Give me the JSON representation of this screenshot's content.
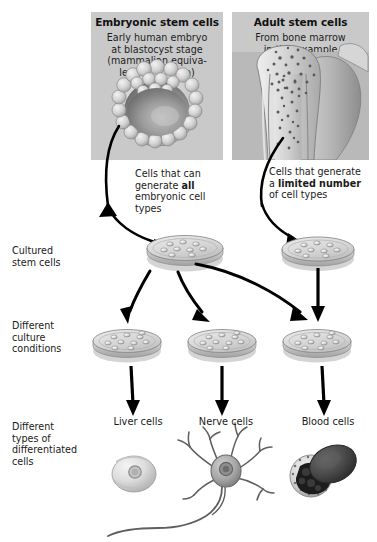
{
  "figure": {
    "background_color": "#ffffff",
    "panel_background_color": "#c9c9c9",
    "arrow_color": "#000000"
  },
  "panels": [
    {
      "id": "embryonic",
      "title": "Embryonic stem cells",
      "subtitle": "Early human embryo\nat blastocyst stage\n(mammalian equiva-\nlent of blastula)",
      "subtitle_lines": [
        "Early human embryo",
        "at blastocyst stage",
        "(mammalian equiva-",
        "lent of blastula)"
      ],
      "illustration": "blastocyst-illustration"
    },
    {
      "id": "adult",
      "title": "Adult stem cells",
      "subtitle_lines": [
        "From bone marrow",
        "in this example"
      ],
      "illustration": "bone-marrow-illustration"
    }
  ],
  "callouts": {
    "embryonic": {
      "line1": "Cells that can",
      "line2_pre": "generate ",
      "line2_bold": "all",
      "line3": "embryonic cell",
      "line4": "types"
    },
    "adult": {
      "line1": "Cells that",
      "line2": "generate a",
      "line3_bold": "limited number",
      "line4": "of cell types"
    }
  },
  "row_labels": [
    {
      "id": "cultured",
      "lines": [
        "Cultured",
        "stem cells"
      ]
    },
    {
      "id": "conditions",
      "lines": [
        "Different",
        "culture",
        "conditions"
      ]
    },
    {
      "id": "types",
      "lines": [
        "Different",
        "types of",
        "differentiated",
        "cells"
      ]
    }
  ],
  "dishes": {
    "cultured": [
      {
        "id": "cultured-dish-embryonic",
        "cell_count": 9
      },
      {
        "id": "cultured-dish-adult",
        "cell_count": 9
      }
    ],
    "conditions": [
      {
        "id": "culture-dish-1",
        "cell_count": 10
      },
      {
        "id": "culture-dish-2",
        "cell_count": 10
      },
      {
        "id": "culture-dish-3",
        "cell_count": 10
      }
    ]
  },
  "differentiated_cells": [
    {
      "id": "liver",
      "label": "Liver cells",
      "illustration": "hepatocyte-illustration"
    },
    {
      "id": "nerve",
      "label": "Nerve cells",
      "illustration": "neuron-illustration"
    },
    {
      "id": "blood",
      "label": "Blood cells",
      "illustration": "blood-cells-illustration"
    }
  ]
}
